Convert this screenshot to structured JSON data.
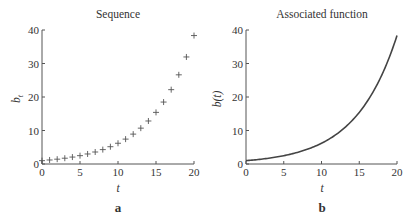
{
  "chart_data": [
    {
      "type": "scatter",
      "panel_label": "a",
      "title": "Sequence",
      "xlabel": "t",
      "ylabel": "b_t",
      "marker": "+",
      "xlim": [
        0,
        20
      ],
      "ylim": [
        0,
        40
      ],
      "xticks": [
        0,
        5,
        10,
        15,
        20
      ],
      "yticks": [
        0,
        10,
        20,
        30,
        40
      ],
      "grid": false,
      "x": [
        0,
        1,
        2,
        3,
        4,
        5,
        6,
        7,
        8,
        9,
        10,
        11,
        12,
        13,
        14,
        15,
        16,
        17,
        18,
        19,
        20
      ],
      "values": [
        1.0,
        1.2,
        1.44,
        1.73,
        2.07,
        2.49,
        2.99,
        3.58,
        4.3,
        5.16,
        6.19,
        7.43,
        8.92,
        10.7,
        12.84,
        15.41,
        18.49,
        22.19,
        26.62,
        31.95,
        38.34
      ]
    },
    {
      "type": "line",
      "panel_label": "b",
      "title": "Associated function",
      "xlabel": "t",
      "ylabel": "b(t)",
      "xlim": [
        0,
        20
      ],
      "ylim": [
        0,
        40
      ],
      "xticks": [
        0,
        5,
        10,
        15,
        20
      ],
      "yticks": [
        0,
        10,
        20,
        30,
        40
      ],
      "grid": false,
      "function": "b(t) = 1.2^t",
      "x": [
        0,
        1,
        2,
        3,
        4,
        5,
        6,
        7,
        8,
        9,
        10,
        11,
        12,
        13,
        14,
        15,
        16,
        17,
        18,
        19,
        20
      ],
      "values": [
        1.0,
        1.2,
        1.44,
        1.73,
        2.07,
        2.49,
        2.99,
        3.58,
        4.3,
        5.16,
        6.19,
        7.43,
        8.92,
        10.7,
        12.84,
        15.41,
        18.49,
        22.19,
        26.62,
        31.95,
        38.34
      ]
    }
  ],
  "panels": {
    "left": {
      "title": "Sequence",
      "ylabel_main": "b",
      "ylabel_sub": "t",
      "xlabel": "t",
      "label": "a"
    },
    "right": {
      "title": "Associated function",
      "ylabel": "b(t)",
      "xlabel": "t",
      "label": "b"
    }
  }
}
